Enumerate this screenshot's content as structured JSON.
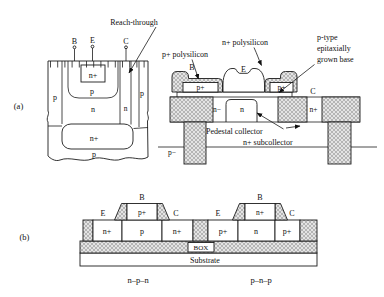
{
  "figure": {
    "panel_a": {
      "tag": "(a)",
      "cross_section": {
        "terminals": {
          "b": "B",
          "e": "E",
          "c": "C"
        },
        "reach_through_callout": "Reach-through",
        "regions": {
          "left_isolation": "p",
          "emitter": "n+",
          "base": "p",
          "collector": "n",
          "reach_through": "n",
          "right_isolation": "p",
          "subcollector": "n+",
          "substrate": "p"
        }
      },
      "device": {
        "terminals": {
          "b": "B",
          "e": "E",
          "c": "C"
        },
        "callouts": {
          "p_polysilicon": "p+ polysilicon",
          "n_polysilicon": "n+ polysilicon",
          "epi_base_line1": "p-type",
          "epi_base_line2": "epitaxially",
          "epi_base_line3": "grown base",
          "pedestal_collector": "Pedestal collector",
          "n_subcollector": "n+ subcollector"
        },
        "regions": {
          "base_contact_left": "p+",
          "base_contact_right": "p+",
          "n_minus": "n−",
          "pedestal": "n",
          "collector_reach": "n+",
          "substrate": "p−"
        }
      }
    },
    "panel_b": {
      "tag": "(b)",
      "npn": {
        "terminals": {
          "b": "B",
          "e": "E",
          "c": "C"
        },
        "gate": "p+",
        "emitter_region": "n+",
        "body_region": "p",
        "collector_region": "n+",
        "caption": "n–p–n"
      },
      "pnp": {
        "terminals": {
          "b": "B",
          "e": "E",
          "c": "C"
        },
        "gate": "n+",
        "emitter_region": "p+",
        "body_region": "n",
        "collector_region": "p+",
        "caption": "p–n–p"
      },
      "box_label": "BOX",
      "substrate_label": "Substrate"
    }
  }
}
